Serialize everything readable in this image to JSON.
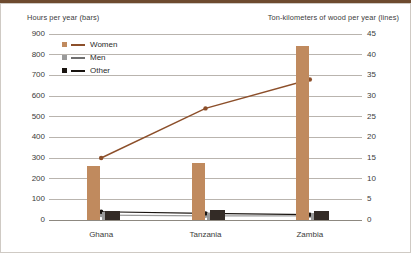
{
  "chart_data": {
    "type": "bar",
    "title": "",
    "subtitle": "",
    "categories": [
      "Ghana",
      "Tanzania",
      "Zambia"
    ],
    "left_axis": {
      "label": "Hours per year (bars)",
      "ticks": [
        0,
        100,
        200,
        300,
        400,
        500,
        600,
        700,
        800,
        900
      ],
      "ylim": [
        0,
        900
      ]
    },
    "right_axis": {
      "label": "Ton-kilometers of wood per year (lines)",
      "ticks": [
        0,
        5,
        10,
        15,
        20,
        25,
        30,
        35,
        40,
        45
      ],
      "ylim": [
        0,
        45
      ]
    },
    "bar_series": [
      {
        "name": "Women",
        "color": "#c08a5e",
        "values": [
          260,
          275,
          840
        ]
      },
      {
        "name": "Men",
        "color": "#9a9a9a",
        "values": [
          40,
          35,
          35
        ]
      },
      {
        "name": "Other",
        "color": "#332b26",
        "values": [
          45,
          50,
          45
        ]
      }
    ],
    "line_series": [
      {
        "name": "Women",
        "color": "#8c4f2a",
        "values": [
          15,
          27,
          34
        ]
      },
      {
        "name": "Men",
        "color": "#9a9a9a",
        "values": [
          1.2,
          1.0,
          1.0
        ]
      },
      {
        "name": "Other",
        "color": "#191410",
        "values": [
          2.0,
          1.6,
          1.3
        ]
      }
    ],
    "grid": true,
    "legend_position": "top-left"
  },
  "legend": {
    "entries": [
      {
        "label": "Women",
        "swatch": "#c08a5e",
        "line": "#8c4f2a"
      },
      {
        "label": "Men",
        "swatch": "#9a9a9a",
        "line": "#6f6f6f"
      },
      {
        "label": "Other",
        "swatch": "#191410",
        "line": "#191410"
      }
    ]
  },
  "axis_captions": {
    "left": "Hours per year (bars)",
    "right": "Ton-kilometers of wood per year (lines)"
  },
  "y_left_ticks": [
    "900",
    "800",
    "700",
    "600",
    "500",
    "400",
    "300",
    "200",
    "100",
    "0"
  ],
  "y_right_ticks": [
    "45",
    "40",
    "35",
    "30",
    "25",
    "20",
    "15",
    "10",
    "5",
    "0"
  ],
  "x_ticks": [
    "Ghana",
    "Tanzania",
    "Zambia"
  ],
  "colors": {
    "women_bar": "#c08a5e",
    "men_bar": "#9a9a9a",
    "other_bar": "#332b26",
    "women_line": "#8c4f2a",
    "gridline": "#b9b4ae",
    "text": "#3b3b3b",
    "top_band": "#6d4a2f"
  }
}
